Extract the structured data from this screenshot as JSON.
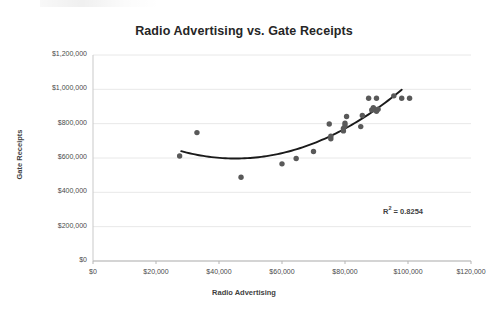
{
  "chart_data": {
    "type": "scatter",
    "title": "Radio Advertising vs. Gate Receipts",
    "xlabel": "Radio Advertising",
    "ylabel": "Gate Receipts",
    "xlim": [
      0,
      120000
    ],
    "ylim": [
      0,
      1200000
    ],
    "grid": true,
    "legend": "none",
    "x_tick_labels": [
      "$0",
      "$20,000",
      "$40,000",
      "$60,000",
      "$80,000",
      "$100,000",
      "$120,000"
    ],
    "x_tick_values": [
      0,
      20000,
      40000,
      60000,
      80000,
      100000,
      120000
    ],
    "y_tick_labels": [
      "$0",
      "$200,000",
      "$400,000",
      "$600,000",
      "$800,000",
      "$1,000,000",
      "$1,200,000"
    ],
    "y_tick_values": [
      0,
      200000,
      400000,
      600000,
      800000,
      1000000,
      1200000
    ],
    "marker_color": "#595959",
    "trendline_color": "#1a1a1a",
    "series": [
      {
        "name": "Gate Receipts",
        "points": [
          [
            27500,
            612000
          ],
          [
            33000,
            748000
          ],
          [
            47000,
            488000
          ],
          [
            60000,
            566000
          ],
          [
            64500,
            597000
          ],
          [
            70000,
            638000
          ],
          [
            75000,
            798000
          ],
          [
            75500,
            712000
          ],
          [
            75500,
            727000
          ],
          [
            79500,
            758000
          ],
          [
            79500,
            772000
          ],
          [
            80000,
            788000
          ],
          [
            80000,
            803000
          ],
          [
            80500,
            842000
          ],
          [
            85000,
            783000
          ],
          [
            85500,
            848000
          ],
          [
            87500,
            948000
          ],
          [
            88500,
            880000
          ],
          [
            89000,
            893000
          ],
          [
            90000,
            948000
          ],
          [
            90000,
            872000
          ],
          [
            90500,
            884000
          ],
          [
            95500,
            962000
          ],
          [
            98000,
            948000
          ],
          [
            100500,
            948000
          ]
        ]
      }
    ],
    "trendline": {
      "type": "polynomial-order-2",
      "r_squared_label": "R² = 0.8254",
      "r_squared_value": 0.8254,
      "x_start": 28000,
      "x_end": 98000
    },
    "annotations": [
      {
        "text": "R² = 0.8254",
        "x": 105000,
        "y": 260000
      }
    ]
  },
  "axis_titles": {
    "x": "Radio Advertising",
    "y": "Gate Receipts"
  },
  "title": "Radio Advertising vs. Gate Receipts",
  "r_squared": {
    "prefix": "R",
    "superscript": "2",
    "suffix": " = 0.8254"
  }
}
